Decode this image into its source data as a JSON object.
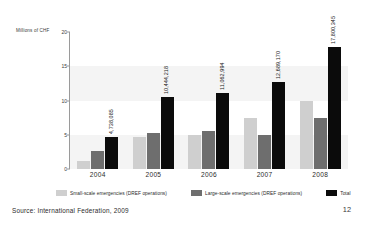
{
  "chart_data": {
    "type": "bar",
    "title": "",
    "subtitle": "",
    "xlabel": "",
    "ylabel": "Millions of CHF",
    "categories": [
      "2004",
      "2005",
      "2006",
      "2007",
      "2008"
    ],
    "ylim": [
      0,
      20
    ],
    "yticks": [
      "0",
      "5",
      "10",
      "15",
      "20"
    ],
    "ytick_values": [
      0,
      5,
      10,
      15,
      20
    ],
    "grid": "horizontal-bands",
    "legend_position": "bottom",
    "series": [
      {
        "name": "Small-scale emergencies (DREF operations)",
        "color": "#cfcfcf",
        "values": [
          1.2,
          4.7,
          5.0,
          7.4,
          10.0
        ],
        "labels": [
          "",
          "",
          "",
          "",
          ""
        ]
      },
      {
        "name": "Large-scale emergencies (DREF operations)",
        "color": "#6e6e6e",
        "values": [
          2.6,
          5.2,
          5.5,
          5.0,
          7.5
        ],
        "labels": [
          "",
          "",
          "",
          "",
          ""
        ]
      },
      {
        "name": "Total",
        "color": "#0b0b0b",
        "values": [
          4.738085,
          10.444218,
          11.062994,
          12.68917,
          17.800345
        ],
        "labels": [
          "4,738,085",
          "10,444,218",
          "11,062,994",
          "12,689,170",
          "17,800,345"
        ]
      }
    ],
    "annotations": [
      "4,738,085",
      "10,444,218",
      "11,062,994",
      "12,689,170",
      "17,800,345"
    ]
  },
  "legend": {
    "items": [
      {
        "label": "Small-scale emergencies (DREF operations)",
        "color": "#cfcfcf"
      },
      {
        "label": "Large-scale emergencies (DREF operations)",
        "color": "#6e6e6e"
      },
      {
        "label": "Total",
        "color": "#0b0b0b"
      }
    ]
  },
  "footer": {
    "source": "Source: International Federation, 2009",
    "page_number": "12"
  }
}
